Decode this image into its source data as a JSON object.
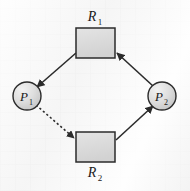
{
  "diagram": {
    "background_color": "#f4f4f4",
    "stroke_color": "#2b2b2b",
    "node_fill": "#dcdcdc",
    "node_fill_light": "#eeeeee",
    "resources": [
      {
        "id": "R1",
        "label": "R",
        "subscript": "1",
        "shape": "rectangle",
        "x": 76,
        "y": 28,
        "width": 39,
        "height": 30,
        "label_x": 95,
        "label_y": 17
      },
      {
        "id": "R2",
        "label": "R",
        "subscript": "2",
        "shape": "rectangle",
        "x": 76,
        "y": 132,
        "width": 39,
        "height": 30,
        "label_x": 95,
        "label_y": 173
      }
    ],
    "processes": [
      {
        "id": "P1",
        "label": "P",
        "subscript": "1",
        "shape": "circle",
        "cx": 27,
        "cy": 96,
        "r": 14
      },
      {
        "id": "P2",
        "label": "P",
        "subscript": "2",
        "shape": "circle",
        "cx": 162,
        "cy": 96,
        "r": 14
      }
    ],
    "edges": [
      {
        "id": "R1-to-P1",
        "from": "R1",
        "to": "P1",
        "type": "assignment",
        "style": "solid",
        "x1": 76,
        "y1": 53,
        "x2": 37,
        "y2": 87
      },
      {
        "id": "P2-to-R1",
        "from": "P2",
        "to": "R1",
        "type": "request",
        "style": "solid",
        "x1": 153,
        "y1": 86,
        "x2": 116,
        "y2": 52
      },
      {
        "id": "P1-to-R2",
        "from": "P1",
        "to": "R2",
        "type": "request",
        "style": "dashed",
        "x1": 36,
        "y1": 105,
        "x2": 75,
        "y2": 139
      },
      {
        "id": "R2-to-P2",
        "from": "R2",
        "to": "P2",
        "type": "assignment",
        "style": "solid",
        "x1": 116,
        "y1": 140,
        "x2": 153,
        "y2": 106
      }
    ]
  }
}
